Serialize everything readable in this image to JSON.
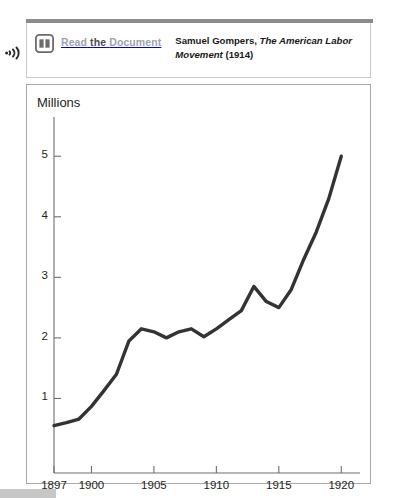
{
  "header": {
    "listen_icon": "audio-listen-icon",
    "book_icon": "open-book-icon",
    "read_link": {
      "word1": "Read",
      "word2": "the",
      "word3": "Document",
      "full": "Read the Document"
    },
    "citation": {
      "author": "Samuel Gompers,",
      "title": "The American Labor Movement",
      "year": "(1914)"
    }
  },
  "colors": {
    "line": "#333333",
    "axis": "#6e6e6e",
    "panel_border": "#a8a8a8",
    "rule": "#8c8c8c",
    "link_muted": "#9aa3ad",
    "link_dark": "#4d4d4d",
    "stub": "#c7c7c7"
  },
  "chart_data": {
    "type": "line",
    "title": "",
    "ylabel": "Millions",
    "xlabel": "",
    "xlim": [
      1897,
      1921.5
    ],
    "ylim": [
      0,
      5.45
    ],
    "grid": false,
    "legend": null,
    "ytick_labels": [
      "1",
      "2",
      "3",
      "4",
      "5"
    ],
    "ytick_values": [
      1,
      2,
      3,
      4,
      5
    ],
    "xtick_labels": [
      "1897",
      "1900",
      "1905",
      "1910",
      "1915",
      "1920"
    ],
    "xtick_values": [
      1897,
      1900,
      1905,
      1910,
      1915,
      1920
    ],
    "series": [
      {
        "name": "Union membership (millions)",
        "x": [
          1897,
          1898,
          1899,
          1900,
          1901,
          1902,
          1903,
          1904,
          1905,
          1906,
          1907,
          1908,
          1909,
          1910,
          1911,
          1912,
          1913,
          1914,
          1915,
          1916,
          1917,
          1918,
          1919,
          1920
        ],
        "values": [
          0.55,
          0.6,
          0.66,
          0.87,
          1.13,
          1.4,
          1.95,
          2.15,
          2.1,
          2.0,
          2.1,
          2.15,
          2.02,
          2.15,
          2.3,
          2.45,
          2.85,
          2.6,
          2.5,
          2.8,
          3.3,
          3.75,
          4.3,
          5.0
        ]
      }
    ]
  }
}
